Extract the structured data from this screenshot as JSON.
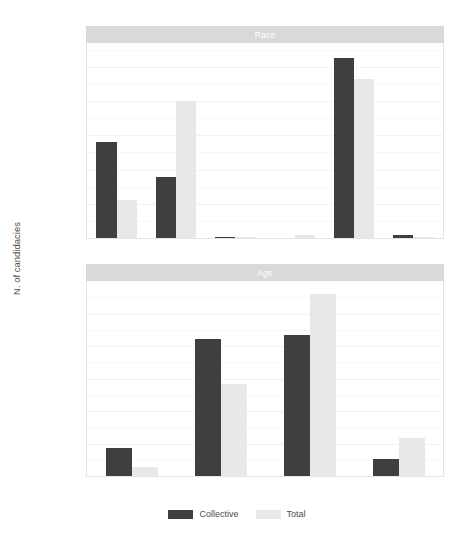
{
  "figure": {
    "y_axis_title": "N. of candidacies",
    "background": "#ffffff",
    "strip_fill": "#d9d9d9",
    "strip_text_color": "#ffffff"
  },
  "legend": {
    "position": "bottom",
    "items": [
      {
        "label": "Collective",
        "color": "#3f3f3f"
      },
      {
        "label": "Total",
        "color": "#e8e8e8"
      }
    ]
  },
  "chart_data": [
    {
      "type": "bar",
      "title": "Race",
      "panel": "top",
      "xlabel": "",
      "ylabel": "N. of candidacies",
      "categories": [
        "Black",
        "Brown",
        "Indigenous",
        "No Info.",
        "White",
        "Yellow"
      ],
      "series": [
        {
          "name": "Collective",
          "color": "#3f3f3f",
          "values": [
            28.0,
            17.7,
            0.4,
            0.0,
            52.5,
            0.8
          ]
        },
        {
          "name": "Total",
          "color": "#e8e8e8",
          "values": [
            11.0,
            40.0,
            0.2,
            0.8,
            46.6,
            0.3
          ]
        }
      ],
      "ylim": [
        0,
        57
      ],
      "yticks": [
        0,
        10,
        20,
        30,
        40,
        50
      ],
      "ytick_labels": [
        "0.0%",
        "10.0%",
        "20.0%",
        "30.0%",
        "40.0%",
        "50.0%"
      ],
      "grid": true,
      "legend_position": "bottom"
    },
    {
      "type": "bar",
      "title": "Age",
      "panel": "bottom",
      "xlabel": "",
      "ylabel": "N. of candidacies",
      "categories": [
        "18-24",
        "25-39",
        "40-59",
        "60+"
      ],
      "series": [
        {
          "name": "Collective",
          "color": "#3f3f3f",
          "values": [
            8.6,
            42.3,
            43.5,
            5.3
          ]
        },
        {
          "name": "Total",
          "color": "#e8e8e8",
          "values": [
            2.7,
            28.4,
            56.0,
            11.6
          ]
        }
      ],
      "ylim": [
        0,
        60
      ],
      "yticks": [
        0,
        10,
        20,
        30,
        40,
        50
      ],
      "ytick_labels": [
        "0.0%",
        "10.0%",
        "20.0%",
        "30.0%",
        "40.0%",
        "50.0%"
      ],
      "grid": true,
      "legend_position": "bottom"
    }
  ]
}
